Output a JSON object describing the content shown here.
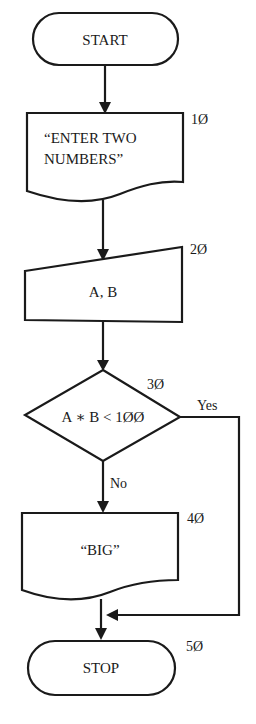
{
  "diagram": {
    "type": "flowchart",
    "nodes": [
      {
        "id": "start",
        "shape": "terminal",
        "text": "START",
        "line_number": ""
      },
      {
        "id": "output_prompt",
        "shape": "document",
        "text_lines": [
          "“ENTER TWO",
          "NUMBERS”"
        ],
        "line_number": "1Ø"
      },
      {
        "id": "input_ab",
        "shape": "manual-input",
        "text": "A, B",
        "line_number": "2Ø"
      },
      {
        "id": "decision",
        "shape": "diamond",
        "text": "A ∗ B < 1ØØ",
        "line_number": "3Ø"
      },
      {
        "id": "output_big",
        "shape": "document",
        "text": "“BIG”",
        "line_number": "4Ø"
      },
      {
        "id": "stop",
        "shape": "terminal",
        "text": "STOP",
        "line_number": "5Ø"
      }
    ],
    "edges": [
      {
        "from": "start",
        "to": "output_prompt",
        "label": ""
      },
      {
        "from": "output_prompt",
        "to": "input_ab",
        "label": ""
      },
      {
        "from": "input_ab",
        "to": "decision",
        "label": ""
      },
      {
        "from": "decision",
        "to": "output_big",
        "label": "No"
      },
      {
        "from": "decision",
        "to": "stop",
        "label": "Yes"
      },
      {
        "from": "output_big",
        "to": "stop",
        "label": ""
      }
    ],
    "branch_labels": {
      "yes": "Yes",
      "no": "No"
    },
    "colors": {
      "stroke": "#1a1a1a",
      "fill": "#ffffff",
      "background": "#ffffff"
    }
  }
}
